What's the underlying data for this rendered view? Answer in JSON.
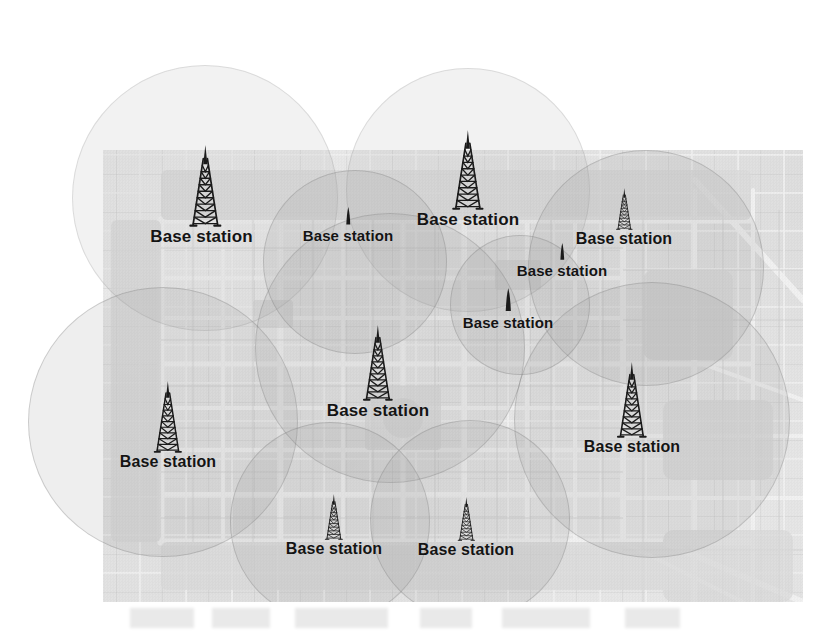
{
  "figure": {
    "kind": "cellular-network-coverage-map",
    "background_map": {
      "name": "adelaide-city-street-map",
      "left": 103,
      "top": 150,
      "width": 700,
      "height": 452,
      "style": "grayscale photocopied street map",
      "visible_map_labels": [
        "Adelaide",
        "North Tce",
        "Nth Tce",
        "South Tce",
        "West Tce",
        "East Tce",
        "Rundle Mall",
        "Rundle Park",
        "Rymill Park",
        "Grote St",
        "Gouger St",
        "Wakefield St",
        "Flinders St",
        "Currie St",
        "Hindley St",
        "Light Square",
        "Hindmarsh Square",
        "Victoria Square",
        "Angas St",
        "Carrington St",
        "Halifax St",
        "Gilles St",
        "Wright St",
        "Sturt St",
        "Bartels Rd",
        "Dequetteville Tce",
        "Botanic Rd",
        "Hutt St",
        "Pulteney St",
        "Unley Rd",
        "Greenhill Rd",
        "Glen Osmond Rd",
        "Comfort Hotel",
        "Art Gallery",
        "University of Adelaide",
        "South Australian Museum",
        "Adelaide Convention Centre",
        "Lutheran Seminary",
        "Prince Alfred College",
        "Victoria Park Racecourse",
        "Adelaide Oval",
        "College Oval"
      ]
    },
    "label_text": "Base station",
    "colors": {
      "map_paper": "#e8e8e8",
      "coverage_fill": "#969696",
      "coverage_stroke": "#787878",
      "label_text": "#141414",
      "page_background": "#ffffff"
    },
    "coverage_cells": [
      {
        "id": "cell-1",
        "cx": 205,
        "cy": 198,
        "r": 133
      },
      {
        "id": "cell-2",
        "cx": 468,
        "cy": 190,
        "r": 122
      },
      {
        "id": "cell-3",
        "cx": 646,
        "cy": 268,
        "r": 118
      },
      {
        "id": "cell-4",
        "cx": 163,
        "cy": 422,
        "r": 135
      },
      {
        "id": "cell-5",
        "cx": 390,
        "cy": 348,
        "r": 135
      },
      {
        "id": "cell-6",
        "cx": 652,
        "cy": 420,
        "r": 138
      },
      {
        "id": "cell-7",
        "cx": 330,
        "cy": 522,
        "r": 100
      },
      {
        "id": "cell-8",
        "cx": 470,
        "cy": 520,
        "r": 100
      },
      {
        "id": "cell-9",
        "cx": 355,
        "cy": 262,
        "r": 92
      },
      {
        "id": "cell-10",
        "cx": 520,
        "cy": 305,
        "r": 70
      }
    ],
    "stations": [
      {
        "id": "station-nw",
        "label": "Base station",
        "x": 205,
        "y": 145,
        "tower_h": 82,
        "tower_w": 42,
        "font_size": 17,
        "label_dx": -7,
        "size": "large"
      },
      {
        "id": "station-n-small",
        "label": "Base station",
        "x": 348,
        "y": 207,
        "tower_h": 20,
        "tower_w": 9,
        "font_size": 15,
        "label_dx": 0,
        "size": "small"
      },
      {
        "id": "station-n-large",
        "label": "Base station",
        "x": 468,
        "y": 130,
        "tower_h": 80,
        "tower_w": 40,
        "font_size": 17,
        "label_dx": 0,
        "size": "large"
      },
      {
        "id": "station-ne",
        "label": "Base station",
        "x": 624,
        "y": 188,
        "tower_h": 42,
        "tower_w": 19,
        "font_size": 16,
        "label_dx": 0,
        "size": "medium"
      },
      {
        "id": "station-e-small",
        "label": "Base station",
        "x": 562,
        "y": 243,
        "tower_h": 19,
        "tower_w": 9,
        "font_size": 15,
        "label_dx": 0,
        "size": "small"
      },
      {
        "id": "station-c-small",
        "label": "Base station",
        "x": 508,
        "y": 288,
        "tower_h": 26,
        "tower_w": 11,
        "font_size": 15,
        "label_dx": 0,
        "size": "small"
      },
      {
        "id": "station-center",
        "label": "Base station",
        "x": 378,
        "y": 325,
        "tower_h": 76,
        "tower_w": 36,
        "font_size": 17,
        "label_dx": 0,
        "size": "large"
      },
      {
        "id": "station-sw",
        "label": "Base station",
        "x": 168,
        "y": 381,
        "tower_h": 72,
        "tower_w": 34,
        "font_size": 16,
        "label_dx": 0,
        "size": "large"
      },
      {
        "id": "station-se",
        "label": "Base station",
        "x": 632,
        "y": 362,
        "tower_h": 76,
        "tower_w": 34,
        "font_size": 16,
        "label_dx": 0,
        "size": "large"
      },
      {
        "id": "station-s1",
        "label": "Base station",
        "x": 334,
        "y": 494,
        "tower_h": 46,
        "tower_w": 20,
        "font_size": 16,
        "label_dx": 0,
        "size": "medium"
      },
      {
        "id": "station-s2",
        "label": "Base station",
        "x": 466,
        "y": 497,
        "tower_h": 44,
        "tower_w": 19,
        "font_size": 16,
        "label_dx": 0,
        "size": "medium"
      }
    ]
  }
}
